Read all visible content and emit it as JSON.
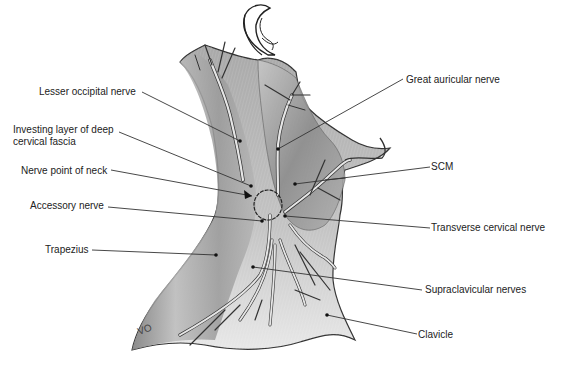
{
  "figure": {
    "artist_signature": "VO",
    "colors": {
      "background": "#ffffff",
      "tissue_light": "#d9d9d9",
      "tissue_mid": "#a8a8a8",
      "tissue_dark": "#6e6e6e",
      "nerve_fill": "#e6e6e6",
      "outline": "#333333",
      "leader": "#333333",
      "text": "#222222"
    }
  },
  "labels": {
    "left": [
      {
        "id": "lesser-occipital",
        "text": "Lesser occipital nerve"
      },
      {
        "id": "investing-layer-1",
        "text": "Investing layer of deep"
      },
      {
        "id": "investing-layer-2",
        "text": "cervical fascia"
      },
      {
        "id": "nerve-point",
        "text": "Nerve point of neck"
      },
      {
        "id": "accessory",
        "text": "Accessory nerve"
      },
      {
        "id": "trapezius",
        "text": "Trapezius"
      }
    ],
    "right": [
      {
        "id": "great-auricular",
        "text": "Great auricular nerve"
      },
      {
        "id": "scm",
        "text": "SCM"
      },
      {
        "id": "transverse-cervical",
        "text": "Transverse cervical nerve"
      },
      {
        "id": "supraclavicular",
        "text": "Supraclavicular nerves"
      },
      {
        "id": "clavicle",
        "text": "Clavicle"
      }
    ]
  }
}
